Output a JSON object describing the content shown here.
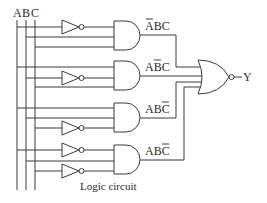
{
  "diagram": {
    "type": "logic-circuit",
    "caption": "Logic circuit",
    "inputs": [
      {
        "name": "A",
        "label": "A"
      },
      {
        "name": "B",
        "label": "B"
      },
      {
        "name": "C",
        "label": "C"
      }
    ],
    "and_gates": [
      {
        "index": 1,
        "label_main": "ABC",
        "overbar_on": "A",
        "expression": "ĀBC"
      },
      {
        "index": 2,
        "label_main": "ABC",
        "overbar_on": "B",
        "expression": "AB̄C"
      },
      {
        "index": 3,
        "label_main": "ABC",
        "overbar_on": "C",
        "expression": "ABC̄"
      },
      {
        "index": 4,
        "label_main": "ABC",
        "overbar_on": "C",
        "expression": "ABC̄"
      }
    ],
    "output_gate": {
      "type": "NOR",
      "output_label": "Y"
    },
    "colors": {
      "line": "#3a3a3a",
      "text": "#2a2a2a",
      "background": "#ffffff"
    }
  }
}
